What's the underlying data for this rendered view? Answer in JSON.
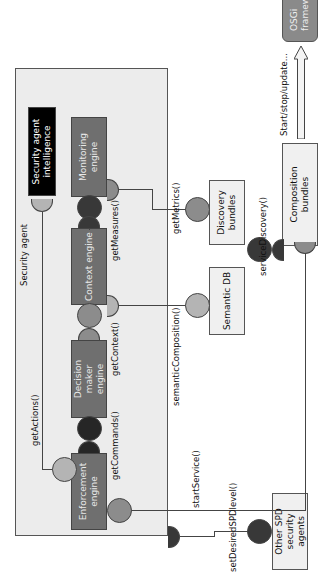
{
  "diagram": {
    "container": {
      "label": "Security agent"
    },
    "components": {
      "intelligence": "Security agent intelligence",
      "monitoring": "Monitoring engine",
      "context": "Context engine",
      "decision": "Decision maker engine",
      "enforcement": "Enforcement engine"
    },
    "external": {
      "discovery": "Discovery bundles",
      "semantic_db": "Semantic DB",
      "composition": "Composition bundles",
      "other_agents": "Other SPD security agents",
      "osgi": "OSGi framework"
    },
    "interfaces": {
      "getActions": "getActions()",
      "getMeasures": "getMeasures()",
      "getContext": "getContext()",
      "getCommands": "getCommands()",
      "getMetrics": "getMetrics()",
      "semanticComposition": "semanticComposition()",
      "serviceDiscovery": "serviceDiscovery()",
      "startService": "startService()",
      "setDesiredSPDlevel": "setDesiredSPDlevel()",
      "lifecycle": "Start/stop/update..."
    },
    "colors": {
      "container_bg": "#ececec",
      "component_bg": "#6f6f6f",
      "intelligence_bg": "#000000",
      "external_bg": "#f0f0f0",
      "osgi_bg": "#8a8a8a"
    }
  }
}
